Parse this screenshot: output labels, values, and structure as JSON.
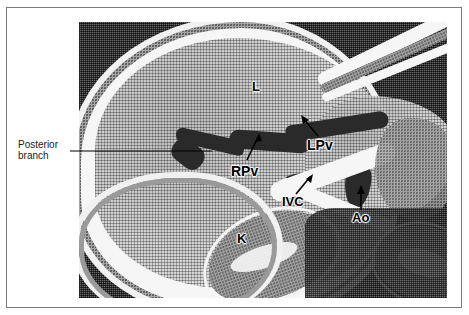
{
  "figure": {
    "type": "medical-ct-scan",
    "modality": "Abdominal CT (axial section)",
    "external_label": {
      "line1": "Posterior",
      "line2": "branch",
      "leader_from_x": 70,
      "leader_to_x": 212,
      "leader_y": 151
    },
    "annotations": [
      {
        "id": "L",
        "text": "L",
        "meaning": "liver",
        "x": 252,
        "y": 80,
        "has_arrow": false
      },
      {
        "id": "LPv",
        "text": "LPv",
        "meaning": "left portal vein",
        "x": 307,
        "y": 138,
        "has_arrow": true
      },
      {
        "id": "RPv",
        "text": "RPv",
        "meaning": "right portal vein",
        "x": 231,
        "y": 164,
        "has_arrow": true
      },
      {
        "id": "IVC",
        "text": "IVC",
        "meaning": "inferior vena cava",
        "x": 282,
        "y": 195,
        "has_arrow": true
      },
      {
        "id": "Ao",
        "text": "Ao",
        "meaning": "aorta",
        "x": 352,
        "y": 211,
        "has_arrow": true
      },
      {
        "id": "K",
        "text": "K",
        "meaning": "kidney",
        "x": 237,
        "y": 232,
        "has_arrow": false
      }
    ],
    "colors": {
      "page_background": "#ffffff",
      "frame_border": "#7b7b7b",
      "scan_background": "#545454",
      "soft_tissue": "#d9d9d9",
      "fat_bright": "#f6f6f6",
      "vessel_dark": "#2a2a2a",
      "annotation_text": "#000000"
    },
    "plate": {
      "x": 79,
      "y": 22,
      "width": 368,
      "height": 276
    }
  }
}
